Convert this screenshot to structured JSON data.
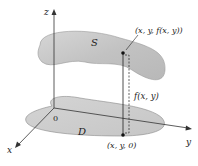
{
  "labels": {
    "z_axis": "z",
    "y_axis": "y",
    "x_axis": "x",
    "origin": "0",
    "surface": "S",
    "region": "D",
    "surface_point": "(x, y, f(x, y))",
    "height": "f(x, y)",
    "base_point": "(x, y, 0)"
  },
  "colors": {
    "surface_fill": "#c9c9c9",
    "region_fill": "#cfcfcf",
    "stroke": "#333333"
  }
}
